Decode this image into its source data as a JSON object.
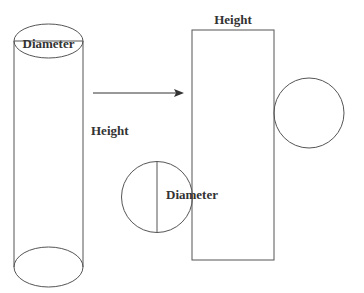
{
  "colors": {
    "stroke": "#555555",
    "text": "#333333",
    "background": "#ffffff"
  },
  "cylinder": {
    "top_label": "Diameter",
    "side_label": "Height"
  },
  "arrow": {
    "direction": "right"
  },
  "net": {
    "rect_label": "Height",
    "circle_label": "Diameter"
  }
}
